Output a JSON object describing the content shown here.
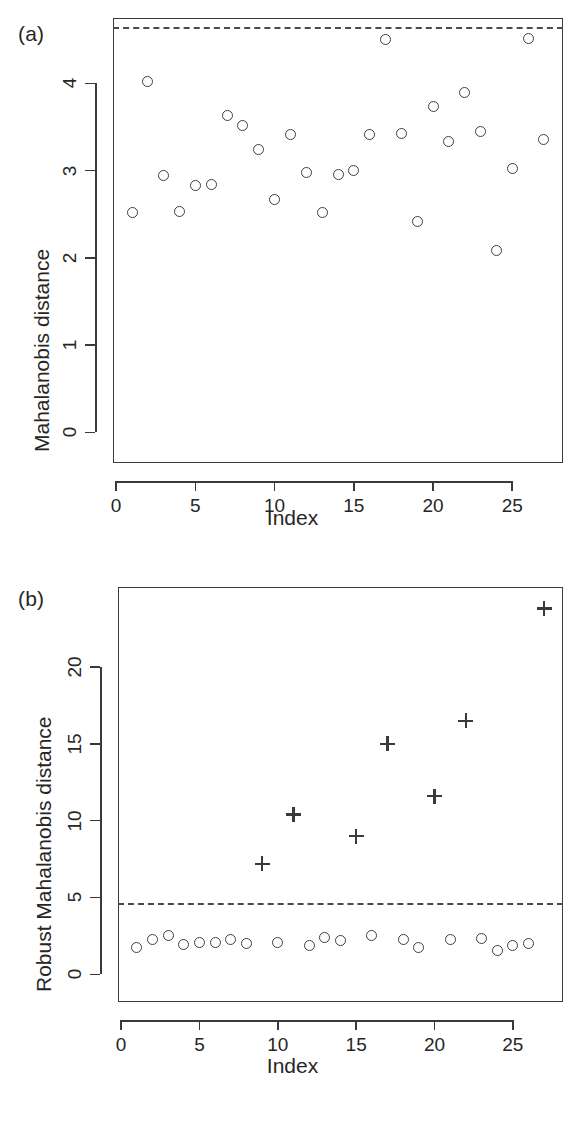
{
  "figure": {
    "panel_a_tag": "(a)",
    "panel_b_tag": "(b)"
  },
  "chart_data": [
    {
      "type": "scatter",
      "panel": "(a)",
      "title": "",
      "xlabel": "Index",
      "ylabel": "Mahalanobis distance",
      "xlim": [
        -0.2,
        28.2
      ],
      "ylim": [
        -0.35,
        4.75
      ],
      "xticks": [
        0,
        5,
        10,
        15,
        20,
        25
      ],
      "yticks": [
        0,
        1,
        2,
        3,
        4
      ],
      "grid": false,
      "legend": "none",
      "cutoff_line": {
        "value": 4.65,
        "style": "dashed",
        "label": ""
      },
      "series": [
        {
          "name": "Mahalanobis distance",
          "marker": "circle",
          "x": [
            1,
            2,
            3,
            4,
            5,
            6,
            7,
            8,
            9,
            10,
            11,
            12,
            13,
            14,
            15,
            16,
            17,
            18,
            19,
            20,
            21,
            22,
            23,
            24,
            25,
            26,
            27
          ],
          "values": [
            2.52,
            4.02,
            2.95,
            2.53,
            2.83,
            2.84,
            3.63,
            3.52,
            3.24,
            2.67,
            3.41,
            2.98,
            2.52,
            2.96,
            3.0,
            3.41,
            4.5,
            3.43,
            2.42,
            3.74,
            3.33,
            3.9,
            3.45,
            2.09,
            3.02,
            4.52,
            3.36
          ]
        }
      ]
    },
    {
      "type": "scatter",
      "panel": "(b)",
      "title": "",
      "xlabel": "Index",
      "ylabel": "Robust Mahalanobis distance",
      "xlim": [
        -0.2,
        28.2
      ],
      "ylim": [
        -1.8,
        25.2
      ],
      "xticks": [
        0,
        5,
        10,
        15,
        20,
        25
      ],
      "yticks": [
        0,
        5,
        10,
        15,
        20
      ],
      "grid": false,
      "legend": "none",
      "cutoff_line": {
        "value": 4.65,
        "style": "dashed",
        "label": ""
      },
      "series": [
        {
          "name": "Non-outliers",
          "marker": "circle",
          "x": [
            1,
            2,
            3,
            4,
            5,
            6,
            7,
            8,
            10,
            12,
            13,
            14,
            16,
            18,
            19,
            21,
            23,
            24,
            25,
            26
          ],
          "values": [
            1.72,
            2.28,
            2.55,
            1.92,
            2.08,
            2.1,
            2.25,
            2.02,
            2.05,
            1.9,
            2.4,
            2.18,
            2.5,
            2.25,
            1.72,
            2.28,
            2.3,
            1.58,
            1.87,
            2.0
          ]
        },
        {
          "name": "Outliers",
          "marker": "plus",
          "x": [
            9,
            11,
            15,
            17,
            20,
            22,
            27
          ],
          "values": [
            7.2,
            10.4,
            9.0,
            15.0,
            11.6,
            16.5,
            23.8
          ]
        }
      ]
    }
  ]
}
